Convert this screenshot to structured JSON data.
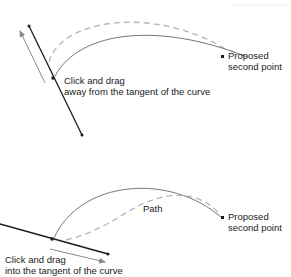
{
  "diagram": {
    "top_panel": {
      "drag_instruction_line1": "Click and drag",
      "drag_instruction_line2": "away from the tangent of the curve",
      "endpoint_label_line1": "Proposed",
      "endpoint_label_line2": "second point"
    },
    "bottom_panel": {
      "path_label": "Path",
      "drag_instruction_line1": "Click and drag",
      "drag_instruction_line2": "into the tangent of the curve",
      "endpoint_label_line1": "Proposed",
      "endpoint_label_line2": "second point"
    },
    "colors": {
      "tangent_line": "#1a1a1a",
      "solid_curve": "#777777",
      "dashed_curve": "#b5b5b5",
      "drag_arrow": "#8a8a8a",
      "text": "#222222"
    }
  }
}
